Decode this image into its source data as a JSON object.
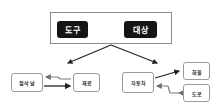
{
  "diagram": {
    "top": {
      "left_label": "도구",
      "right_label": "대상",
      "relation": "bidirectional"
    },
    "left_branch": {
      "source_label": "절삭 날",
      "target_label": "재료"
    },
    "right_branch": {
      "source_label": "자동차",
      "target_upper_label": "화물",
      "target_lower_label": "도로"
    },
    "colors": {
      "dark_box": "#151515",
      "border": "#9a9a9a",
      "solid_arrow": "#222222",
      "soft_arrow": "#7a7a7a"
    }
  }
}
